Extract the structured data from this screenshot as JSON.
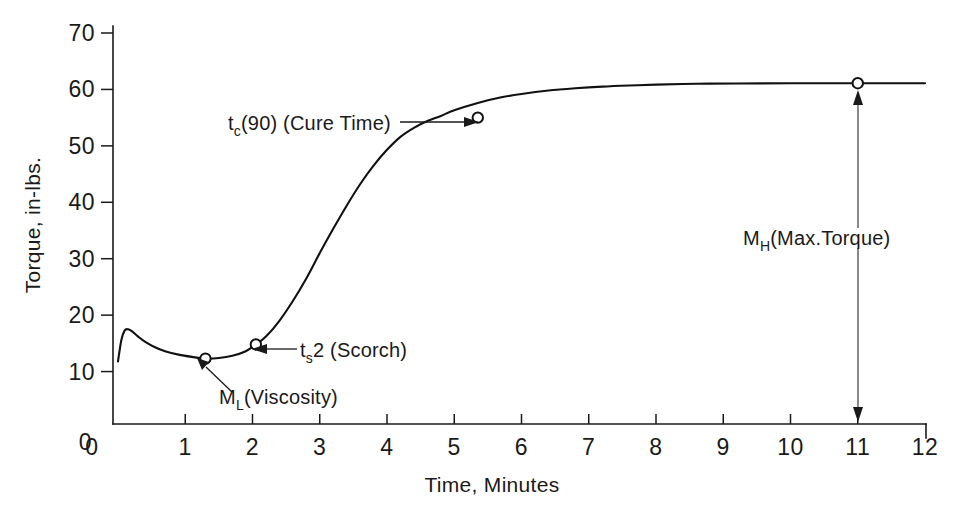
{
  "chart_data": {
    "type": "line",
    "title": "",
    "xlabel": "Time, Minutes",
    "ylabel": "Torque, in-lbs.",
    "xlim": [
      0,
      12
    ],
    "ylim": [
      0,
      70
    ],
    "grid": false,
    "legend": "none",
    "x_ticks": [
      "0",
      "1",
      "2",
      "3",
      "4",
      "5",
      "6",
      "7",
      "8",
      "9",
      "10",
      "11",
      "12"
    ],
    "x_tick_values": [
      0,
      1,
      2,
      3,
      4,
      5,
      6,
      7,
      8,
      9,
      10,
      11,
      12
    ],
    "y_ticks": [
      "0",
      "10",
      "20",
      "30",
      "40",
      "50",
      "60",
      "70"
    ],
    "y_tick_values": [
      0,
      10,
      20,
      30,
      40,
      50,
      60,
      70
    ],
    "series": [
      {
        "name": "Cure curve",
        "x": [
          0.0,
          0.05,
          0.1,
          0.15,
          0.2,
          0.3,
          0.4,
          0.55,
          0.7,
          0.9,
          1.1,
          1.3,
          1.5,
          1.7,
          1.9,
          2.05,
          2.2,
          2.4,
          2.6,
          2.8,
          3.0,
          3.2,
          3.4,
          3.6,
          3.8,
          4.0,
          4.2,
          4.4,
          4.6,
          4.8,
          5.0,
          5.35,
          5.7,
          6.0,
          6.4,
          6.8,
          7.2,
          7.6,
          8.0,
          8.6,
          9.2,
          10.0,
          11.0,
          12.0
        ],
        "y": [
          11.8,
          15.6,
          17.3,
          17.5,
          17.2,
          16.2,
          15.3,
          14.3,
          13.6,
          13.0,
          12.6,
          12.3,
          12.4,
          12.8,
          13.6,
          14.8,
          16.2,
          19.0,
          22.5,
          26.5,
          31.0,
          35.3,
          39.4,
          43.2,
          46.5,
          49.3,
          51.6,
          53.2,
          54.4,
          55.3,
          56.3,
          57.6,
          58.6,
          59.2,
          59.8,
          60.2,
          60.5,
          60.7,
          60.85,
          61.0,
          61.05,
          61.1,
          61.1,
          61.1
        ]
      }
    ],
    "markers": [
      {
        "id": "viscosity",
        "x": 1.3,
        "y": 12.3
      },
      {
        "id": "scorch",
        "x": 2.05,
        "y": 14.8
      },
      {
        "id": "cure-time",
        "x": 5.35,
        "y": 55.0
      },
      {
        "id": "max-torque",
        "x": 11.0,
        "y": 61.1
      }
    ],
    "annotations": [
      {
        "id": "cure-time",
        "base": "t",
        "sub": "c",
        "rest": "(90) (Cure Time)",
        "text": "t c (90) (Cure Time)",
        "points_to": {
          "x": 5.35,
          "y": 55.0
        }
      },
      {
        "id": "scorch",
        "base": "t",
        "sub": "s",
        "rest": "2 (Scorch)",
        "text": "t s 2 (Scorch)",
        "points_to": {
          "x": 2.05,
          "y": 14.8
        }
      },
      {
        "id": "viscosity",
        "base": "M",
        "sub": "L",
        "rest": "(Viscosity)",
        "text": "M L (Viscosity)",
        "points_to": {
          "x": 1.3,
          "y": 12.3
        }
      },
      {
        "id": "max-torque",
        "base": "M",
        "sub": "H",
        "rest": "(Max.Torque)",
        "text": "M H (Max.Torque)",
        "points_to": {
          "x": 11.0,
          "y": 61.1
        }
      }
    ],
    "colors": {
      "curve": "#111111",
      "axis": "#1a1a1a",
      "background": "#ffffff",
      "marker_fill": "#ffffff"
    }
  }
}
